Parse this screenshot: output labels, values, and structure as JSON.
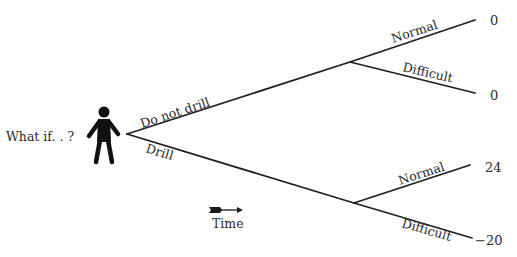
{
  "diagram": {
    "type": "decision-tree",
    "root_label": "What if. . ?",
    "decision_node": {
      "icon": "person-icon",
      "options": [
        {
          "label": "Do not drill",
          "chance_node": {
            "outcomes": [
              {
                "label": "Normal",
                "payoff": "0"
              },
              {
                "label": "Difficult",
                "payoff": "0"
              }
            ]
          }
        },
        {
          "label": "Drill",
          "chance_node": {
            "outcomes": [
              {
                "label": "Normal",
                "payoff": "24"
              },
              {
                "label": "Difficult",
                "payoff": "−20"
              }
            ]
          }
        }
      ]
    },
    "time_axis": {
      "label": "Time",
      "icon": "arrow-right-icon"
    }
  },
  "colors": {
    "line": "#1f1f1f",
    "text": "#2a2a2a",
    "background": "#ffffff"
  }
}
